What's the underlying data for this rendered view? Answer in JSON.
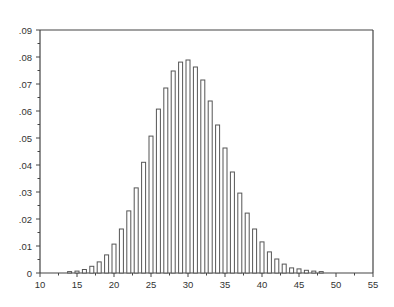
{
  "chart_data": {
    "type": "bar",
    "title": "",
    "xlabel": "",
    "ylabel": "",
    "xlim": [
      10,
      55
    ],
    "ylim": [
      0,
      0.09
    ],
    "grid": false,
    "legend": null,
    "x_ticks": [
      10,
      15,
      20,
      25,
      30,
      35,
      40,
      45,
      50,
      55
    ],
    "x_tick_labels": [
      "10",
      "15",
      "20",
      "25",
      "30",
      "35",
      "40",
      "45",
      "50",
      "55"
    ],
    "y_ticks": [
      0,
      0.01,
      0.02,
      0.03,
      0.04,
      0.05,
      0.06,
      0.07,
      0.08,
      0.09
    ],
    "y_tick_labels": [
      "0",
      ".01",
      ".02",
      ".03",
      ".04",
      ".05",
      ".06",
      ".07",
      ".08",
      ".09"
    ],
    "categories": [
      14,
      15,
      16,
      17,
      18,
      19,
      20,
      21,
      22,
      23,
      24,
      25,
      26,
      27,
      28,
      29,
      30,
      31,
      32,
      33,
      34,
      35,
      36,
      37,
      38,
      39,
      40,
      41,
      42,
      43,
      44,
      45,
      46,
      47,
      48
    ],
    "values": [
      0.0005,
      0.0007,
      0.0013,
      0.0025,
      0.0041,
      0.0067,
      0.0107,
      0.0163,
      0.023,
      0.0315,
      0.041,
      0.0507,
      0.0607,
      0.0685,
      0.0748,
      0.0781,
      0.0789,
      0.0763,
      0.0715,
      0.0637,
      0.0548,
      0.0463,
      0.0374,
      0.0296,
      0.0222,
      0.0163,
      0.0115,
      0.0078,
      0.0052,
      0.0033,
      0.0019,
      0.0015,
      0.001,
      0.0007,
      0.0005
    ],
    "colors": {
      "bar_stroke": "#555555",
      "bar_fill": "#ffffff",
      "axis": "#444444"
    }
  }
}
